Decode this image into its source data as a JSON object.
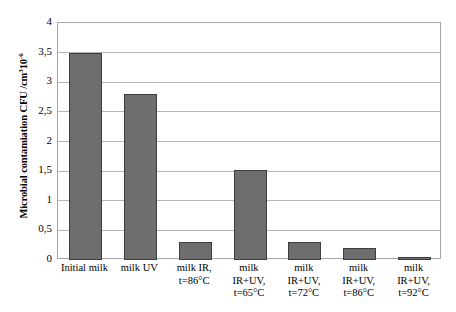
{
  "chart_data": {
    "type": "bar",
    "title": "",
    "xlabel": "",
    "ylabel": "Microbial contamiation CFU /cm³10⁻⁶",
    "ylabel_parts": {
      "main": "Microbial contamiation CFU /cm",
      "sup1": "3",
      "mid": "10",
      "sup2": "-6"
    },
    "categories": [
      "Initial milk",
      "milk UV",
      "milk IR, t=86°C",
      "milk IR+UV, t=65°C",
      "milk IR+UV, t=72°C",
      "milk IR+UV, t=86°C",
      "milk IR+UV, t=92°C"
    ],
    "category_lines": [
      [
        "Initial milk"
      ],
      [
        "milk UV"
      ],
      [
        "milk IR,",
        "t=86°C"
      ],
      [
        "milk",
        "IR+UV,",
        "t=65°C"
      ],
      [
        "milk",
        "IR+UV,",
        "t=72°C"
      ],
      [
        "milk",
        "IR+UV,",
        "t=86°C"
      ],
      [
        "milk",
        "IR+UV,",
        "t=92°C"
      ]
    ],
    "values": [
      3.5,
      2.8,
      0.3,
      1.52,
      0.3,
      0.2,
      0.05
    ],
    "ylim": [
      0,
      4
    ],
    "ytick_values": [
      0,
      0.5,
      1,
      1.5,
      2,
      2.5,
      3,
      3.5,
      4
    ],
    "ytick_labels": [
      "0",
      "0,5",
      "1",
      "1,5",
      "2",
      "2,5",
      "3",
      "3,5",
      "4"
    ],
    "grid": "horizontal",
    "legend": "none",
    "colors": {
      "bar_fill": "#6e6e6e",
      "bar_edge": "#3d3d3d",
      "gridline": "#b5b5b5",
      "frame": "#a6a6a6",
      "background": "#ffffff",
      "text": "#000000"
    }
  }
}
